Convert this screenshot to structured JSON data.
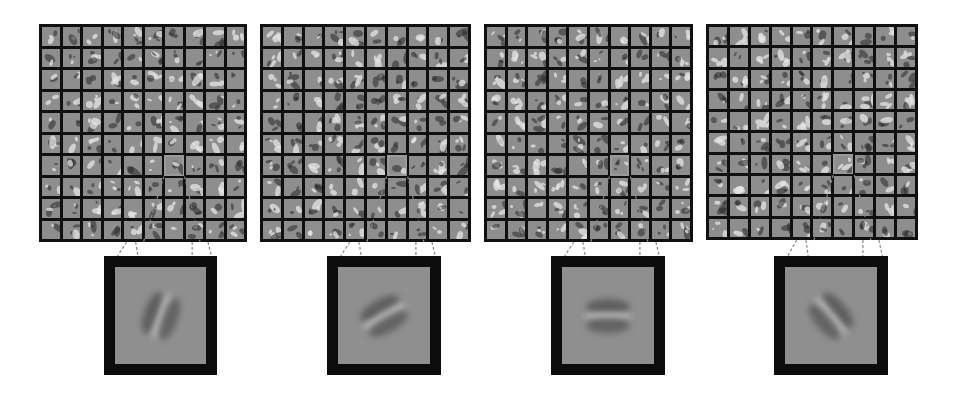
{
  "figure": {
    "colors": {
      "background": "#ffffff",
      "grid_border": "#101010",
      "patch_gray": "#8e8e8e",
      "highlight_outline": "#9a9a9a",
      "connector": "#8a8a8a"
    },
    "panels": [
      {
        "id": 1,
        "grid": {
          "x": 39,
          "y": 24,
          "w": 208,
          "h": 218,
          "rows": 10,
          "cols": 10
        },
        "highlight": {
          "row": 6,
          "col": 6
        },
        "zoom": {
          "x": 104,
          "y": 256,
          "w": 113,
          "h": 119
        },
        "filter_orientation_deg": 70,
        "filter_desc": "oriented edge, steep diagonal"
      },
      {
        "id": 2,
        "grid": {
          "x": 260,
          "y": 24,
          "w": 211,
          "h": 218,
          "rows": 10,
          "cols": 10
        },
        "highlight": {
          "row": 6,
          "col": 6
        },
        "zoom": {
          "x": 327,
          "y": 256,
          "w": 114,
          "h": 119
        },
        "filter_orientation_deg": 30,
        "filter_desc": "oriented edge, shallow diagonal"
      },
      {
        "id": 3,
        "grid": {
          "x": 484,
          "y": 24,
          "w": 209,
          "h": 218,
          "rows": 10,
          "cols": 10
        },
        "highlight": {
          "row": 6,
          "col": 6
        },
        "zoom": {
          "x": 551,
          "y": 256,
          "w": 114,
          "h": 119
        },
        "filter_orientation_deg": 0,
        "filter_desc": "horizontal edge"
      },
      {
        "id": 4,
        "grid": {
          "x": 706,
          "y": 24,
          "w": 212,
          "h": 216,
          "rows": 10,
          "cols": 10
        },
        "highlight": {
          "row": 6,
          "col": 6
        },
        "zoom": {
          "x": 774,
          "y": 256,
          "w": 114,
          "h": 119
        },
        "filter_orientation_deg": -50,
        "filter_desc": "oriented edge, anti-diagonal"
      }
    ]
  }
}
